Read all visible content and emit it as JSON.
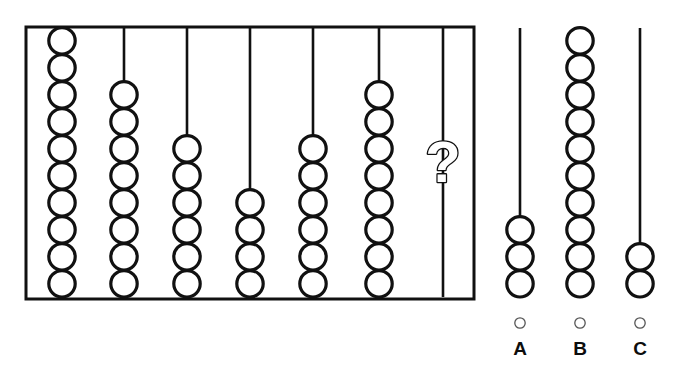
{
  "puzzle": {
    "type": "visual-pattern-sequence",
    "prompt_symbol": "?",
    "colors": {
      "ink": "#111111",
      "bead_stroke": "#111111",
      "bead_fill": "#ffffff",
      "frame": "#111111",
      "radio_stroke": "#555555",
      "label": "#0d0d0d",
      "background": "#ffffff"
    }
  },
  "abacus": {
    "name": "abacus-frame",
    "rod_count": 7,
    "max_beads_per_rod": 10,
    "frame": {
      "x": 26,
      "y": 27,
      "width": 448,
      "height": 272,
      "stroke_width": 3
    },
    "rods": [
      {
        "index": 1,
        "label": "rod-1",
        "x": 62,
        "beads": 10,
        "unknown": false
      },
      {
        "index": 2,
        "label": "rod-2",
        "x": 124,
        "beads": 8,
        "unknown": false
      },
      {
        "index": 3,
        "label": "rod-3",
        "x": 187,
        "beads": 6,
        "unknown": false
      },
      {
        "index": 4,
        "label": "rod-4",
        "x": 250,
        "beads": 4,
        "unknown": false
      },
      {
        "index": 5,
        "label": "rod-5",
        "x": 313,
        "beads": 6,
        "unknown": false
      },
      {
        "index": 6,
        "label": "rod-6",
        "x": 379,
        "beads": 8,
        "unknown": false
      },
      {
        "index": 7,
        "label": "rod-7",
        "x": 443,
        "beads": 0,
        "unknown": true
      }
    ]
  },
  "choices": [
    {
      "id": "A",
      "letter": "A",
      "x": 520,
      "beads": 3,
      "selected": false
    },
    {
      "id": "B",
      "letter": "B",
      "x": 580,
      "beads": 10,
      "selected": false
    },
    {
      "id": "C",
      "letter": "C",
      "x": 640,
      "beads": 2,
      "selected": false
    }
  ],
  "geometry": {
    "bead_radius": 13.2,
    "bead_pitch": 27.0,
    "bead_stroke_width": 3.2,
    "rod_stroke_width": 2.6,
    "rod_top_y": 28,
    "rod_bottom_y": 297,
    "choice_rod_top_y": 28,
    "choice_rod_bottom_y": 297,
    "radio_y": 323,
    "radio_radius": 5.2,
    "label_y": 355
  },
  "question_mark": {
    "name": "question-mark-glyph",
    "text": "?",
    "center_x": 443,
    "center_y": 162,
    "font_size": 58,
    "style": "outline"
  }
}
